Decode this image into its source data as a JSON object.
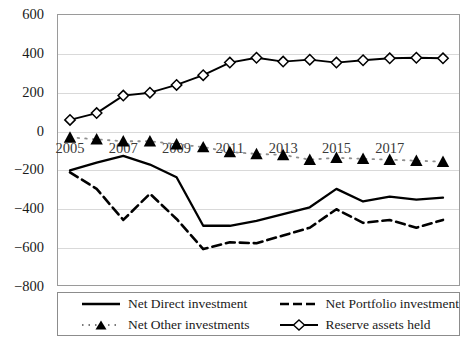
{
  "chart_data": {
    "type": "line",
    "title": "",
    "xlabel": "",
    "ylabel": "",
    "ylim": [
      -800,
      600
    ],
    "ytick_labels": [
      "600",
      "400",
      "200",
      "0",
      "-200",
      "-400",
      "-600",
      "-800"
    ],
    "ytick_values": [
      600,
      400,
      200,
      0,
      -200,
      -400,
      -600,
      -800
    ],
    "grid": true,
    "legend_position": "bottom",
    "x": [
      2005,
      2006,
      2007,
      2008,
      2009,
      2010,
      2011,
      2012,
      2013,
      2014,
      2015,
      2016,
      2017,
      2018,
      2019
    ],
    "xtick_labels": [
      "2005",
      "2007",
      "2009",
      "2011",
      "2013",
      "2015",
      "2017"
    ],
    "xtick_values": [
      2005,
      2007,
      2009,
      2011,
      2013,
      2015,
      2017
    ],
    "series": [
      {
        "name": "Net Direct investment",
        "style": "solid",
        "marker": "none",
        "color": "#000000",
        "values": [
          -205,
          -165,
          -130,
          -175,
          -240,
          -490,
          -490,
          -465,
          -430,
          -395,
          -300,
          -365,
          -340,
          -355,
          -345
        ]
      },
      {
        "name": "Net Portfolio investment",
        "style": "dashed",
        "marker": "none",
        "color": "#000000",
        "values": [
          -215,
          -300,
          -460,
          -325,
          -455,
          -610,
          -575,
          -580,
          -540,
          -500,
          -405,
          -475,
          -460,
          -500,
          -460
        ]
      },
      {
        "name": "Net Other investments",
        "style": "dotted",
        "marker": "triangle",
        "color": "#000000",
        "values": [
          -35,
          -45,
          -55,
          -55,
          -70,
          -85,
          -110,
          -120,
          -125,
          -150,
          -140,
          -145,
          -150,
          -155,
          -160
        ]
      },
      {
        "name": "Reserve assets held",
        "style": "solid",
        "marker": "diamond",
        "color": "#000000",
        "values": [
          55,
          90,
          180,
          195,
          235,
          285,
          350,
          375,
          355,
          365,
          350,
          362,
          372,
          375,
          372
        ]
      }
    ]
  },
  "legend": {
    "items": [
      {
        "label": "Net Direct investment"
      },
      {
        "label": "Net Portfolio investment"
      },
      {
        "label": "Net Other investments"
      },
      {
        "label": "Reserve assets held"
      }
    ]
  }
}
